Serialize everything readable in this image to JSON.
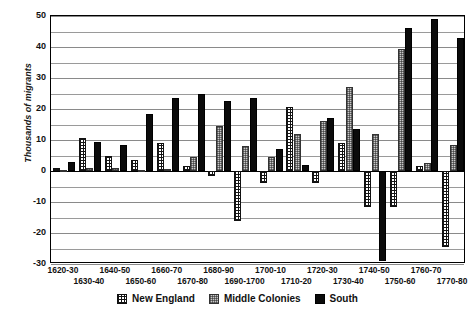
{
  "chart_data": {
    "type": "bar",
    "title": "",
    "xlabel": "",
    "ylabel": "Thousands of migrants",
    "ylim": [
      -30,
      50
    ],
    "ytick_labels": [
      "50",
      "40",
      "30",
      "20",
      "10",
      "0",
      "-10",
      "-20",
      "-30"
    ],
    "ytick_values": [
      50,
      40,
      30,
      20,
      10,
      0,
      -10,
      -20,
      -30
    ],
    "grid": true,
    "grid_step": 5,
    "legend_position": "bottom",
    "categories": [
      "1620-30",
      "1630-40",
      "1640-50",
      "1650-60",
      "1660-70",
      "1670-80",
      "1680-90",
      "1690-1700",
      "1700-10",
      "1710-20",
      "1720-30",
      "1730-40",
      "1740-50",
      "1750-60",
      "1760-70",
      "1770-80"
    ],
    "series": [
      {
        "name": "New England",
        "pattern": "crosshatch",
        "color": "#ffffff",
        "values": [
          1.0,
          10.5,
          5.0,
          3.5,
          9.0,
          1.5,
          -1.5,
          -16.0,
          -4.0,
          20.5,
          -4.0,
          9.0,
          -11.5,
          -11.5,
          1.5,
          -24.5
        ]
      },
      {
        "name": "Middle Colonies",
        "pattern": "stipple",
        "color": "#c9c9c9",
        "values": [
          0.3,
          1.0,
          1.0,
          0.3,
          0.5,
          4.5,
          14.5,
          8.0,
          4.5,
          12.0,
          16.0,
          27.0,
          12.0,
          39.5,
          2.5,
          8.5
        ]
      },
      {
        "name": "South",
        "pattern": "solid",
        "color": "#0b0b0b",
        "values": [
          3.0,
          9.5,
          8.5,
          18.5,
          23.5,
          25.0,
          22.5,
          23.5,
          7.0,
          2.0,
          17.0,
          13.5,
          -29.0,
          46.0,
          49.0,
          43.0
        ]
      }
    ]
  },
  "legend": {
    "items": [
      {
        "label": "New England"
      },
      {
        "label": "Middle Colonies"
      },
      {
        "label": "South"
      }
    ]
  }
}
